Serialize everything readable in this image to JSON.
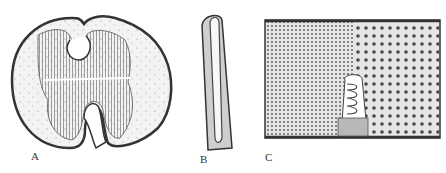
{
  "figure": {
    "panels": [
      {
        "id": "A",
        "label": "A",
        "description": "cross-section, bilobed organ with radial striations"
      },
      {
        "id": "B",
        "label": "B",
        "description": "elongated rod-shaped cell"
      },
      {
        "id": "C",
        "label": "C",
        "description": "rectangular tissue block with dotted cells and coiled structure"
      }
    ]
  }
}
